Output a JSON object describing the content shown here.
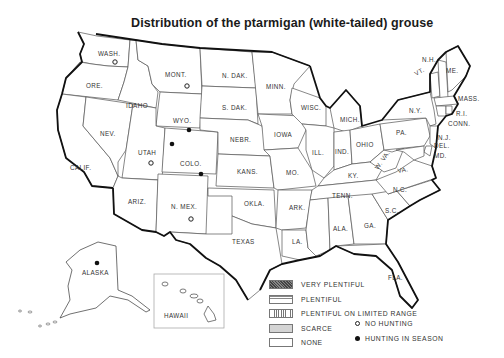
{
  "title": "Distribution of the ptarmigan (white-tailed) grouse",
  "legend": {
    "categories": [
      {
        "key": "very_plentiful",
        "label": "VERY PLENTIFUL",
        "pattern": "crosshatch-dark"
      },
      {
        "key": "plentiful",
        "label": "PLENTIFUL",
        "pattern": "horizontal-lines"
      },
      {
        "key": "plentiful_limited",
        "label": "PLENTIFUL ON LIMITED RANGE",
        "pattern": "vertical-lines"
      },
      {
        "key": "scarce",
        "label": "SCARCE",
        "pattern": "light-gray"
      },
      {
        "key": "none",
        "label": "NONE",
        "pattern": "white"
      }
    ],
    "symbols": [
      {
        "key": "no_hunting",
        "label": "NO HUNTING",
        "icon": "open-circle-icon"
      },
      {
        "key": "hunting_in_season",
        "label": "HUNTING IN SEASON",
        "icon": "filled-circle-icon"
      }
    ]
  },
  "states": {
    "wash": {
      "label": "WASH.",
      "status": "plentiful_limited",
      "hunting": "no_hunting"
    },
    "ore": {
      "label": "ORE.",
      "status": "none"
    },
    "calif": {
      "label": "CALIF.",
      "status": "none"
    },
    "idaho": {
      "label": "IDAHO",
      "status": "none"
    },
    "nev": {
      "label": "NEV.",
      "status": "none"
    },
    "mont": {
      "label": "MONT.",
      "status": "scarce",
      "hunting": "no_hunting"
    },
    "wyo": {
      "label": "WYO.",
      "status": "plentiful_limited",
      "hunting": "hunting_in_season"
    },
    "utah": {
      "label": "UTAH",
      "status": "scarce",
      "hunting": "no_hunting"
    },
    "colo": {
      "label": "COLO.",
      "status": "plentiful_limited",
      "hunting": "hunting_in_season"
    },
    "ariz": {
      "label": "ARIZ.",
      "status": "none"
    },
    "nmex": {
      "label": "N. MEX.",
      "status": "scarce",
      "hunting": "no_hunting"
    },
    "ndak": {
      "label": "N. DAK.",
      "status": "none"
    },
    "sdak": {
      "label": "S. DAK.",
      "status": "none"
    },
    "nebr": {
      "label": "NEBR.",
      "status": "none"
    },
    "kans": {
      "label": "KANS.",
      "status": "none"
    },
    "okla": {
      "label": "OKLA.",
      "status": "none"
    },
    "texas": {
      "label": "TEXAS",
      "status": "none"
    },
    "minn": {
      "label": "MINN.",
      "status": "none"
    },
    "iowa": {
      "label": "IOWA",
      "status": "none"
    },
    "mo": {
      "label": "MO.",
      "status": "none"
    },
    "ark": {
      "label": "ARK.",
      "status": "none"
    },
    "la": {
      "label": "LA.",
      "status": "none"
    },
    "wisc": {
      "label": "WISC.",
      "status": "none"
    },
    "ill": {
      "label": "ILL.",
      "status": "none"
    },
    "mich": {
      "label": "MICH.",
      "status": "none"
    },
    "ind": {
      "label": "IND.",
      "status": "none"
    },
    "ohio": {
      "label": "OHIO",
      "status": "none"
    },
    "ky": {
      "label": "KY.",
      "status": "none"
    },
    "tenn": {
      "label": "TENN.",
      "status": "none"
    },
    "miss": {
      "label": "",
      "status": "none"
    },
    "ala": {
      "label": "ALA.",
      "status": "none"
    },
    "ga": {
      "label": "GA.",
      "status": "none"
    },
    "fla": {
      "label": "FLA.",
      "status": "none"
    },
    "sc": {
      "label": "S.C.",
      "status": "none"
    },
    "nc": {
      "label": "N.C.",
      "status": "none"
    },
    "va": {
      "label": "VA.",
      "status": "none"
    },
    "wva": {
      "label": "W. VA.",
      "status": "none"
    },
    "pa": {
      "label": "PA.",
      "status": "none"
    },
    "ny": {
      "label": "N.Y.",
      "status": "none"
    },
    "vt": {
      "label": "VT.",
      "status": "none"
    },
    "nh": {
      "label": "N.H.",
      "status": "none"
    },
    "me": {
      "label": "ME.",
      "status": "none"
    },
    "mass": {
      "label": "MASS.",
      "status": "none"
    },
    "ri": {
      "label": "R.I.",
      "status": "none"
    },
    "conn": {
      "label": "CONN.",
      "status": "none"
    },
    "nj": {
      "label": "N.J.",
      "status": "none"
    },
    "del": {
      "label": "DEL.",
      "status": "none"
    },
    "md": {
      "label": "MD.",
      "status": "none"
    },
    "alaska": {
      "label": "ALASKA",
      "status": "plentiful_limited",
      "hunting": "hunting_in_season"
    },
    "hawaii": {
      "label": "HAWAII",
      "status": "none"
    }
  },
  "extra_markers": [
    {
      "near": "utah-wyo-colo corner",
      "hunting": "hunting_in_season"
    }
  ],
  "colors": {
    "scarce_fill": "#d4d4d4",
    "line": "#111111",
    "text": "#333333"
  }
}
